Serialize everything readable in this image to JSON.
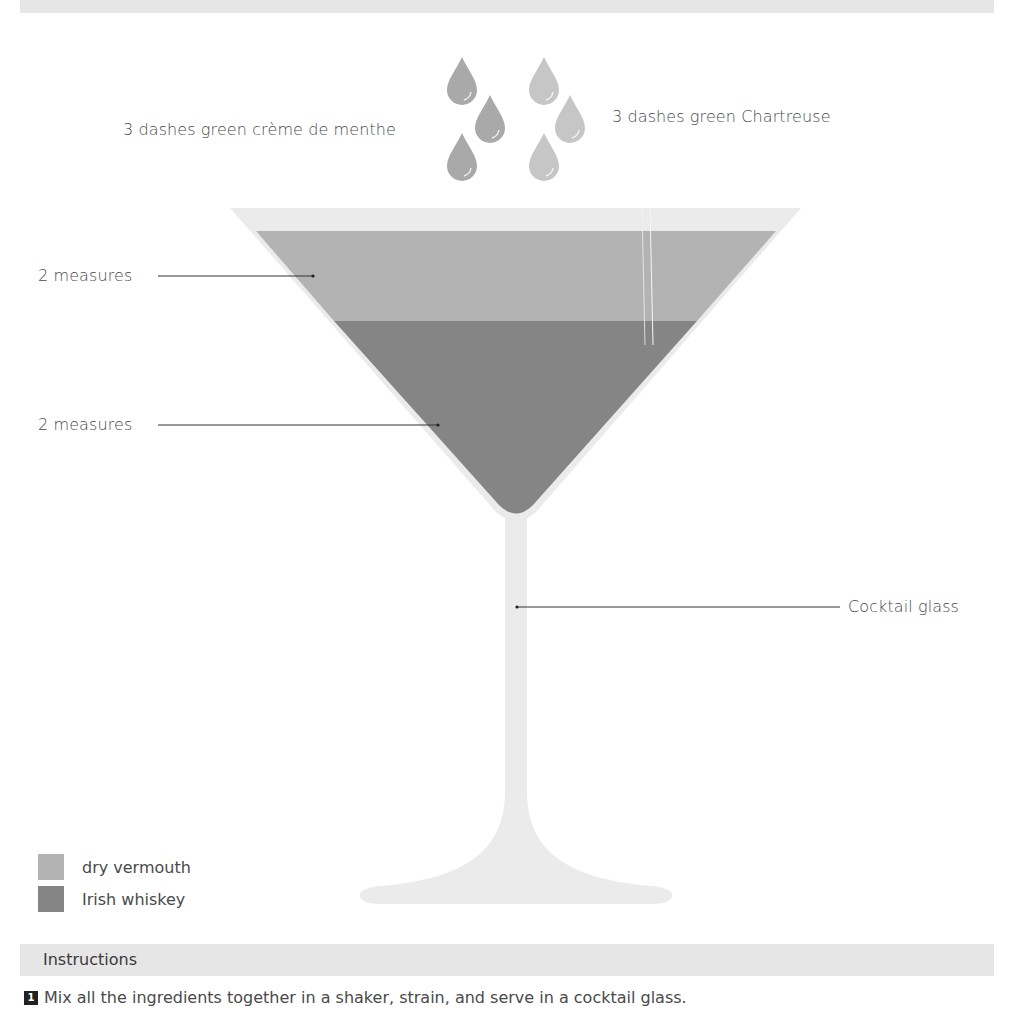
{
  "colors": {
    "glass": "#ebebeb",
    "dry_vermouth": "#b3b3b3",
    "irish_whiskey": "#858585",
    "drop_dark": "#a9a9a9",
    "drop_light": "#c6c6c6",
    "band": "#e6e6e6"
  },
  "garnish": {
    "left_label": "3 dashes green crème de menthe",
    "right_label": "3 dashes green Chartreuse"
  },
  "layers": [
    {
      "label": "2 measures",
      "ingredient": "dry vermouth"
    },
    {
      "label": "2 measures",
      "ingredient": "Irish whiskey"
    }
  ],
  "glass_label": "Cocktail glass",
  "legend": {
    "items": [
      {
        "label": "dry vermouth",
        "color": "#b3b3b3"
      },
      {
        "label": "Irish whiskey",
        "color": "#858585"
      }
    ]
  },
  "instructions": {
    "title": "Instructions",
    "steps": [
      {
        "number": "1",
        "text": "Mix all the ingredients together in a shaker, strain, and serve in a cocktail glass."
      }
    ]
  }
}
